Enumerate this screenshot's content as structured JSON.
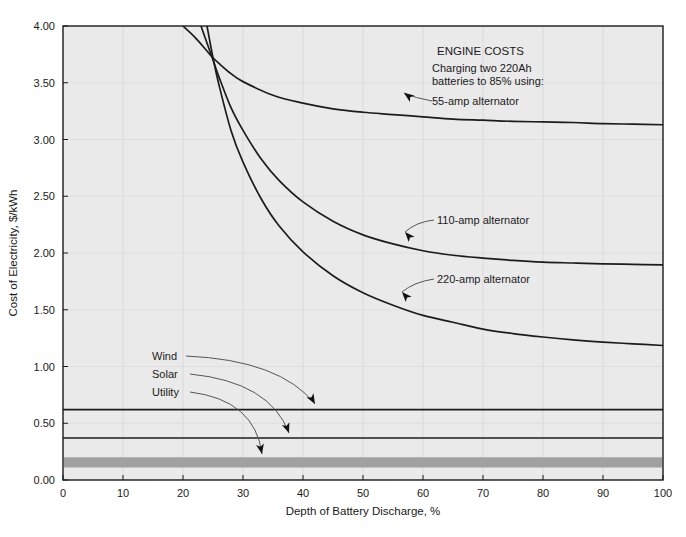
{
  "chart_data": {
    "type": "line",
    "title": "",
    "xlabel": "Depth of Battery Discharge, %",
    "ylabel": "Cost of Electricity, $/kWh",
    "xlim": [
      0,
      100
    ],
    "ylim": [
      0.0,
      4.0
    ],
    "xticks": [
      "0",
      "10",
      "20",
      "30",
      "40",
      "50",
      "60",
      "70",
      "80",
      "90",
      "100"
    ],
    "yticks": [
      "0.00",
      "0.50",
      "1.00",
      "1.50",
      "2.00",
      "2.50",
      "3.00",
      "3.50",
      "4.00"
    ],
    "grid": true,
    "legend": "none",
    "plot_bg": "#eaeaea",
    "line_color": "#1c1c1c",
    "band_color": "#a0a0a0",
    "series": [
      {
        "name": "55-amp alternator",
        "label": "55-amp alternator",
        "x": [
          20,
          22,
          24,
          25,
          26,
          28,
          30,
          35,
          40,
          45,
          50,
          55,
          60,
          65,
          70,
          75,
          80,
          85,
          90,
          95,
          100
        ],
        "values": [
          4.0,
          3.9,
          3.78,
          3.72,
          3.67,
          3.58,
          3.51,
          3.39,
          3.32,
          3.27,
          3.24,
          3.22,
          3.2,
          3.18,
          3.17,
          3.16,
          3.155,
          3.15,
          3.14,
          3.135,
          3.13
        ]
      },
      {
        "name": "110-amp alternator",
        "label": "110-amp alternator",
        "x": [
          23,
          24,
          25,
          26,
          28,
          30,
          33,
          36,
          40,
          45,
          50,
          55,
          60,
          65,
          70,
          75,
          80,
          85,
          90,
          95,
          100
        ],
        "values": [
          4.0,
          3.85,
          3.7,
          3.55,
          3.28,
          3.08,
          2.83,
          2.64,
          2.45,
          2.28,
          2.16,
          2.08,
          2.02,
          1.98,
          1.955,
          1.935,
          1.92,
          1.912,
          1.905,
          1.9,
          1.895
        ]
      },
      {
        "name": "220-amp alternator",
        "label": "220-amp alternator",
        "x": [
          24,
          25,
          26,
          28,
          30,
          33,
          36,
          40,
          45,
          50,
          55,
          60,
          65,
          70,
          75,
          80,
          85,
          90,
          95,
          100
        ],
        "values": [
          4.0,
          3.72,
          3.48,
          3.08,
          2.8,
          2.48,
          2.24,
          2.01,
          1.8,
          1.65,
          1.54,
          1.45,
          1.39,
          1.33,
          1.29,
          1.26,
          1.235,
          1.215,
          1.2,
          1.185
        ]
      }
    ],
    "reference_lines": [
      {
        "name": "Wind",
        "label": "Wind",
        "value": 0.62,
        "kind": "line"
      },
      {
        "name": "Solar",
        "label": "Solar",
        "value": 0.37,
        "kind": "line"
      },
      {
        "name": "Utility",
        "label": "Utility",
        "value": 0.155,
        "kind": "band",
        "band_low": 0.11,
        "band_high": 0.2
      }
    ],
    "annotations": {
      "engine_costs_title": "ENGINE COSTS",
      "engine_costs_line1": "Charging two 220Ah",
      "engine_costs_line2": "batteries to 85% using:"
    }
  }
}
